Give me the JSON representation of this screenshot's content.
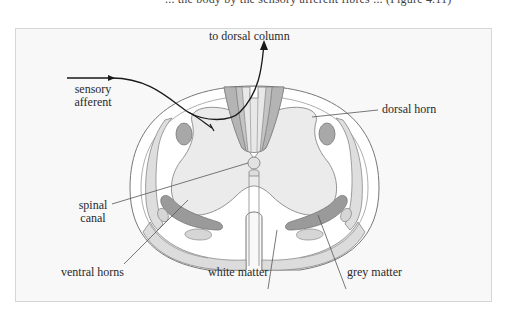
{
  "context_text": "... the body by the sensory afferent fibres ... (Figure 4.11)",
  "figure": {
    "labels": {
      "to_dorsal_column": "to dorsal column",
      "sensory_afferent_line1": "sensory",
      "sensory_afferent_line2": "afferent",
      "dorsal_horn": "dorsal horn",
      "spinal_canal_line1": "spinal",
      "spinal_canal_line2": "canal",
      "ventral_horns": "ventral horns",
      "white_matter": "white matter",
      "grey_matter": "grey matter"
    },
    "colors": {
      "frame_background": "#f8f8f8",
      "white_matter": "#ffffff",
      "grey_matter": "#ebebeb",
      "dorsal_column_dark": "#b4b4b4",
      "dorsal_column_light": "#e6e6e6",
      "tract_dark": "#9a9a9a",
      "tract_light": "#d9d9d9",
      "outline": "#777777",
      "pathway": "#1a1a1a"
    }
  }
}
